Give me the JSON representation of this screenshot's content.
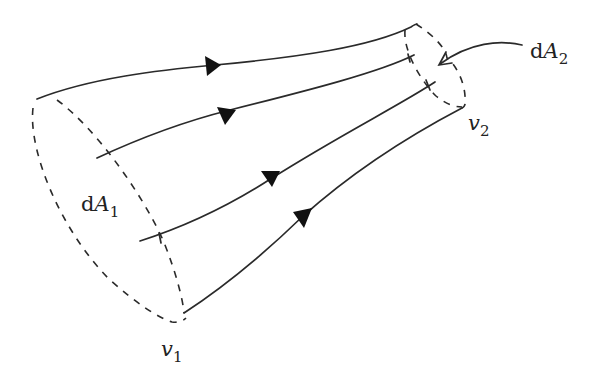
{
  "diagram": {
    "colors": {
      "ink": "#2a2a2a",
      "arrowhead": "#111111",
      "background": "#ffffff"
    },
    "labels": {
      "dA1": {
        "prefix": "d",
        "symbol": "A",
        "subscript": "1"
      },
      "dA2": {
        "prefix": "d",
        "symbol": "A",
        "subscript": "2"
      },
      "v1": {
        "symbol": "v",
        "subscript": "1"
      },
      "v2": {
        "symbol": "v",
        "subscript": "2"
      }
    },
    "streamlines": [
      {
        "id": "streamline-1",
        "direction": "left-to-right"
      },
      {
        "id": "streamline-2",
        "direction": "left-to-right"
      },
      {
        "id": "streamline-3",
        "direction": "left-to-right"
      },
      {
        "id": "streamline-4",
        "direction": "left-to-right"
      }
    ],
    "cross_sections": [
      {
        "id": "inlet",
        "label": "dA1",
        "velocity": "v1",
        "style": "dashed"
      },
      {
        "id": "outlet",
        "label": "dA2",
        "velocity": "v2",
        "style": "dashed"
      }
    ],
    "pointer": {
      "from": "dA2-label",
      "to": "outlet-cross-section"
    }
  }
}
